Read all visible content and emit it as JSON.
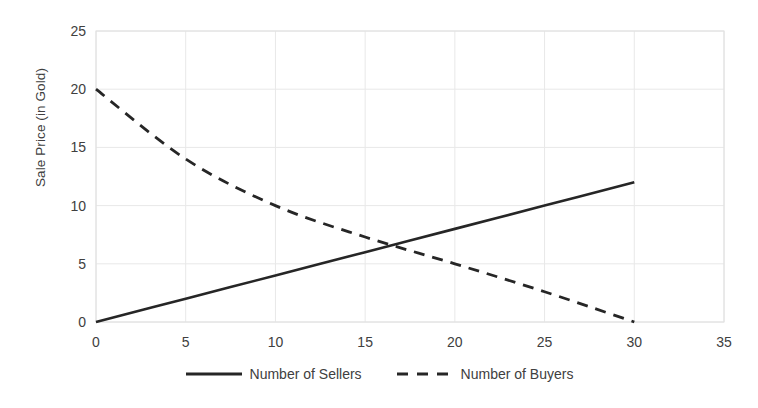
{
  "chart_data": {
    "type": "line",
    "title": "",
    "subtitle": "",
    "xlabel": "",
    "ylabel": "Sale Price (in Gold)",
    "xlim": [
      0,
      35
    ],
    "ylim": [
      0,
      25
    ],
    "xticks": [
      "0",
      "5",
      "10",
      "15",
      "20",
      "25",
      "30",
      "35"
    ],
    "xtick_values": [
      0,
      5,
      10,
      15,
      20,
      25,
      30,
      35
    ],
    "yticks": [
      "0",
      "5",
      "10",
      "15",
      "20",
      "25"
    ],
    "ytick_values": [
      0,
      5,
      10,
      15,
      20,
      25
    ],
    "grid": true,
    "grid_color": "#e8e8e8",
    "legend_position": "bottom-center",
    "series": [
      {
        "name": "Number of Sellers",
        "style": "solid",
        "color": "#262626",
        "width": 2.6,
        "x": [
          0,
          5,
          10,
          15,
          20,
          25,
          30
        ],
        "values": [
          0,
          2,
          4,
          6,
          8,
          10,
          12
        ]
      },
      {
        "name": "Number of Buyers",
        "style": "dashed",
        "color": "#262626",
        "width": 2.8,
        "dash": "11 8",
        "x": [
          0,
          5,
          10,
          15,
          20,
          25,
          30
        ],
        "values": [
          20,
          14,
          10,
          7.3,
          5,
          2.6,
          0
        ]
      }
    ],
    "annotations": [],
    "equilibrium": {
      "x": 16,
      "y": 6.4
    }
  },
  "legend": {
    "items": [
      {
        "label": "Number of Sellers",
        "swatch": "solid-line-swatch"
      },
      {
        "label": "Number of Buyers",
        "swatch": "dashed-line-swatch"
      }
    ]
  },
  "axes": {
    "y_title": "Sale Price (in Gold)",
    "x_title": ""
  }
}
